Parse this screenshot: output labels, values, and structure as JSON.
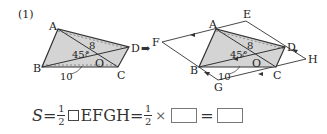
{
  "problem": {
    "number": "(1)"
  },
  "figure_left": {
    "labels": {
      "A": "A",
      "B": "B",
      "C": "C",
      "D": "D",
      "O": "O"
    },
    "measures": {
      "diagonal": "8",
      "angle": "45°",
      "base": "10"
    }
  },
  "figure_right": {
    "labels": {
      "A": "A",
      "B": "B",
      "C": "C",
      "D": "D",
      "O": "O",
      "E": "E",
      "F": "F",
      "G": "G",
      "H": "H"
    },
    "measures": {
      "diagonal": "8",
      "angle": "45°",
      "base": "10"
    }
  },
  "arrow": "➡",
  "formula": {
    "lhs": "S",
    "eq1": "=",
    "half_num": "1",
    "half_den": "2",
    "parallelogram_name": "EFGH",
    "eq2": "=",
    "times": "×",
    "eq3": "=",
    "blank1": "",
    "blank2": ""
  },
  "colors": {
    "shade": "#d4d4d4",
    "line": "#333333"
  }
}
